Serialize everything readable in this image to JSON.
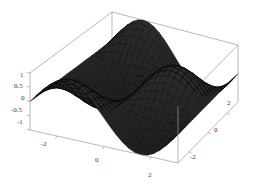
{
  "figure": {
    "kind": "3d-surface-plot",
    "background_color": "#ffffff",
    "box_line_color": "#999999",
    "surface_fill_color": "#2a2a2a",
    "surface_mesh_color": "#000000",
    "tick_label_color": "#3a3a3a"
  },
  "chart_data": {
    "type": "surface",
    "title": "",
    "xlabel": "",
    "ylabel": "",
    "zlabel": "",
    "grid": false,
    "legend": "none",
    "function": "sin(x) * cos(y)",
    "xlim": [
      -3.14159,
      3.14159
    ],
    "ylim": [
      -3.14159,
      3.14159
    ],
    "zlim": [
      -1,
      1
    ],
    "x_ticks": [
      -2,
      0,
      2
    ],
    "x_tick_labels": [
      "-2",
      "0",
      "2"
    ],
    "y_ticks": [
      2,
      0,
      -2
    ],
    "y_tick_labels": [
      "2",
      "0",
      "-2"
    ],
    "z_ticks": [
      1,
      0.5,
      0,
      -0.5,
      -1
    ],
    "z_tick_labels": [
      "1",
      "0.5",
      "0",
      "-0.5",
      "-1"
    ],
    "mesh_n_x": 24,
    "mesh_n_y": 24,
    "view_azimuth_deg": -50,
    "view_elevation_deg": 22,
    "z_values_note": "z = sin(x)*cos(y) sampled on a 24x24 grid over [-pi,pi]^2, range -1..1"
  },
  "z_axis": {
    "name": "z-axis",
    "ticks": [
      {
        "label": "1",
        "x": 20,
        "y": 72
      },
      {
        "label": "0.5",
        "x": 14,
        "y": 83
      },
      {
        "label": "0",
        "x": 21,
        "y": 95
      },
      {
        "label": "-0.5",
        "x": 11,
        "y": 107
      },
      {
        "label": "-1",
        "x": 17,
        "y": 119
      }
    ]
  },
  "x_axis": {
    "name": "x-axis",
    "ticks": [
      {
        "label": "-2",
        "x": 41,
        "y": 141
      },
      {
        "label": "0",
        "x": 95,
        "y": 157
      },
      {
        "label": "2",
        "x": 148,
        "y": 172
      }
    ]
  },
  "y_axis": {
    "name": "y-axis",
    "ticks": [
      {
        "label": "2",
        "x": 227,
        "y": 100
      },
      {
        "label": "0",
        "x": 214,
        "y": 127
      },
      {
        "label": "-2",
        "x": 190,
        "y": 154
      }
    ]
  }
}
